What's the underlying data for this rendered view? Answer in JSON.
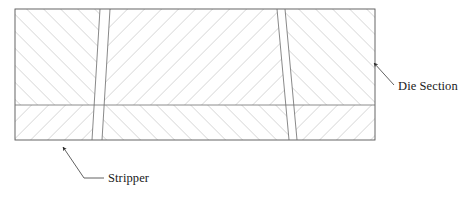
{
  "figure": {
    "type": "engineering-cross-section-diagram",
    "background_color": "#ffffff",
    "line_color": "#6b6b6b",
    "outline_color": "#555555",
    "hatch_color": "#8c8c8c",
    "leader_color": "#3a3a3a",
    "text_color": "#1a1a1a"
  },
  "die_body": {
    "name": "die-section-body",
    "left": 15,
    "top": 9,
    "right": 375,
    "bottom": 140,
    "centerline_y": 105,
    "outline_stroke_width": 0.9
  },
  "slots": [
    {
      "name": "slot-left",
      "top_x_start": 100,
      "top_x_end": 110,
      "bottom_x_start": 92,
      "bottom_x_end": 102
    },
    {
      "name": "slot-right",
      "top_x_start": 277,
      "top_x_end": 285,
      "bottom_x_start": 289,
      "bottom_x_end": 297
    }
  ],
  "hatching": {
    "spacing": 8.5,
    "stroke_width": 0.55,
    "angle_degrees": 45,
    "description": "45-degree section hatching, mirrored across the horizontal centerline to form chevrons"
  },
  "callouts": [
    {
      "id": "die-section",
      "label": "Die Section",
      "text_x": 398,
      "text_y": 90,
      "leader_start_x": 394,
      "leader_start_y": 85,
      "leader_end_x": 372,
      "leader_end_y": 62,
      "arrow_at": "end",
      "arrow_angle_degrees": 226
    },
    {
      "id": "stripper",
      "label": "Stripper",
      "text_x": 108,
      "text_y": 182,
      "leader_start_x": 104,
      "leader_start_y": 178,
      "leader_mid_x": 83,
      "leader_mid_y": 178,
      "leader_end_x": 62,
      "leader_end_y": 146,
      "arrow_at": "end",
      "arrow_angle_degrees": 237
    }
  ]
}
